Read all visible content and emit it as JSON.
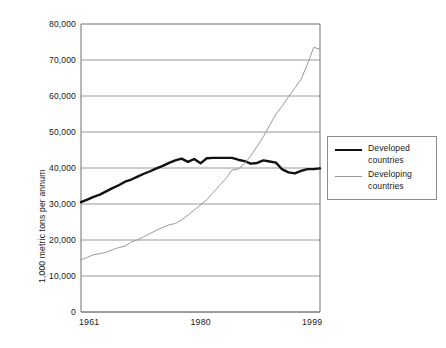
{
  "chart_data": {
    "type": "line",
    "title": "",
    "xlabel": "",
    "ylabel": "1,000 metric tons per annum",
    "xlim": [
      1961,
      1999
    ],
    "ylim": [
      0,
      80000
    ],
    "grid": true,
    "legend_position": "right",
    "ytick_labels": [
      "80,000",
      "70,000",
      "60,000",
      "50,000",
      "40,000",
      "30,000",
      "20,000",
      "10,000",
      "0"
    ],
    "ytick_values": [
      80000,
      70000,
      60000,
      50000,
      40000,
      30000,
      20000,
      10000,
      0
    ],
    "xtick_labels": [
      "1961",
      "1980",
      "1999"
    ],
    "xtick_values": [
      1961,
      1980,
      1999
    ],
    "x": [
      1961,
      1962,
      1963,
      1964,
      1965,
      1966,
      1967,
      1968,
      1969,
      1970,
      1971,
      1972,
      1973,
      1974,
      1975,
      1976,
      1977,
      1978,
      1979,
      1980,
      1981,
      1982,
      1983,
      1984,
      1985,
      1986,
      1987,
      1988,
      1989,
      1990,
      1991,
      1992,
      1993,
      1994,
      1995,
      1996,
      1997,
      1998,
      1999
    ],
    "series": [
      {
        "name": "Developed countries",
        "color": "#111111",
        "width": 2.4,
        "values": [
          30500,
          31200,
          32000,
          32600,
          33500,
          34400,
          35200,
          36200,
          36800,
          37600,
          38400,
          39100,
          39900,
          40600,
          41400,
          42100,
          42600,
          41700,
          42500,
          41300,
          42700,
          42800,
          42800,
          42800,
          42800,
          42300,
          41900,
          41200,
          41400,
          42100,
          41800,
          41500,
          39600,
          38800,
          38500,
          39200,
          39700,
          39700,
          39900
        ]
      },
      {
        "name": "Developing countries",
        "color": "#9a9a9a",
        "width": 1.0,
        "values": [
          14500,
          15200,
          15900,
          16200,
          16600,
          17300,
          17900,
          18300,
          19400,
          20100,
          20900,
          21800,
          22700,
          23500,
          24200,
          24600,
          25600,
          26900,
          28300,
          29700,
          31200,
          33100,
          35100,
          37000,
          39400,
          39700,
          41200,
          43400,
          46000,
          48700,
          51900,
          55000,
          57200,
          59800,
          62200,
          64700,
          68800,
          73500,
          73000
        ]
      }
    ]
  },
  "legend": {
    "items": [
      {
        "label_line1": "Developed",
        "label_line2": "countries"
      },
      {
        "label_line1": "Developing",
        "label_line2": "countries"
      }
    ]
  },
  "colors": {
    "developed": "#111111",
    "developing": "#9a9a9a",
    "grid": "#8c8c8c",
    "frame": "#6e6e6e",
    "background": "#ffffff"
  }
}
